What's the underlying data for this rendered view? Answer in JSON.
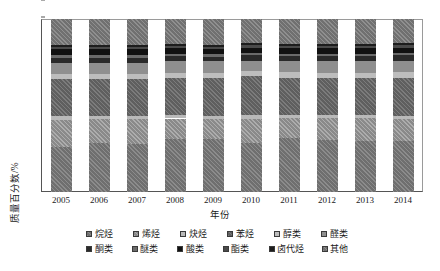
{
  "chart_data": {
    "type": "bar",
    "stacked": true,
    "title": "",
    "xlabel": "年份",
    "ylabel": "质量百分数/%",
    "ylim": [
      0,
      100
    ],
    "ytick_step": 10,
    "yticks": [
      "0",
      "10",
      "20",
      "30",
      "40",
      "50",
      "60",
      "70",
      "80",
      "90",
      "100"
    ],
    "grid": false,
    "legend_position": "bottom",
    "categories": [
      "2005",
      "2006",
      "2007",
      "2008",
      "2009",
      "2010",
      "2011",
      "2012",
      "2013",
      "2014"
    ],
    "series": [
      {
        "name": "烷烃",
        "key": "alkane",
        "values": [
          26.0,
          28.5,
          28.0,
          30.5,
          30.5,
          28.5,
          31.0,
          30.0,
          29.5,
          29.5
        ]
      },
      {
        "name": "烯烃",
        "key": "alkene",
        "values": [
          15.8,
          13.5,
          14.0,
          12.0,
          11.5,
          13.5,
          11.5,
          12.5,
          13.0,
          12.5
        ]
      },
      {
        "name": "炔烃",
        "key": "alkyne",
        "values": [
          2.2,
          2.0,
          2.0,
          2.0,
          2.0,
          2.5,
          2.0,
          2.0,
          2.0,
          2.0
        ]
      },
      {
        "name": "苯烃",
        "key": "benzene",
        "values": [
          21.5,
          21.5,
          21.5,
          21.5,
          22.0,
          22.5,
          21.5,
          21.5,
          21.5,
          22.0
        ]
      },
      {
        "name": "醇类",
        "key": "alcohol",
        "values": [
          3.0,
          3.0,
          3.0,
          3.0,
          3.0,
          3.0,
          3.5,
          3.0,
          3.0,
          3.5
        ]
      },
      {
        "name": "醛类",
        "key": "aldehyde",
        "values": [
          6.0,
          6.0,
          6.0,
          6.5,
          6.5,
          6.0,
          6.5,
          6.5,
          6.5,
          6.5
        ]
      },
      {
        "name": "酮类",
        "key": "ketone",
        "values": [
          3.0,
          3.0,
          3.0,
          3.0,
          2.5,
          3.0,
          2.5,
          3.0,
          3.0,
          3.0
        ]
      },
      {
        "name": "醚类",
        "key": "ether",
        "values": [
          1.5,
          1.5,
          1.5,
          1.5,
          1.5,
          1.5,
          1.5,
          1.5,
          1.5,
          1.5
        ]
      },
      {
        "name": "酸类",
        "key": "acid",
        "values": [
          3.5,
          3.5,
          3.5,
          3.0,
          3.0,
          3.0,
          3.0,
          3.0,
          3.0,
          3.0
        ]
      },
      {
        "name": "酯类",
        "key": "ester",
        "values": [
          1.5,
          1.5,
          1.5,
          1.5,
          1.5,
          1.5,
          1.5,
          1.5,
          1.5,
          1.5
        ]
      },
      {
        "name": "卤代烃",
        "key": "halo",
        "values": [
          1.0,
          1.0,
          1.0,
          1.0,
          1.0,
          1.0,
          1.0,
          1.0,
          1.0,
          1.0
        ]
      },
      {
        "name": "其他",
        "key": "other",
        "values": [
          15.0,
          15.0,
          15.0,
          14.5,
          15.0,
          14.0,
          14.5,
          14.5,
          14.5,
          14.0
        ]
      }
    ]
  },
  "legend": {
    "row1": [
      {
        "label": "烷烃",
        "key": "alkane"
      },
      {
        "label": "烯烃",
        "key": "alkene"
      },
      {
        "label": "炔烃",
        "key": "alkyne"
      },
      {
        "label": "苯烃",
        "key": "benzene"
      },
      {
        "label": "醇类",
        "key": "alcohol"
      },
      {
        "label": "醛类",
        "key": "aldehyde"
      }
    ],
    "row2": [
      {
        "label": "酮类",
        "key": "ketone"
      },
      {
        "label": "醚类",
        "key": "ether"
      },
      {
        "label": "酸类",
        "key": "acid"
      },
      {
        "label": "酯类",
        "key": "ester"
      },
      {
        "label": "卤代烃",
        "key": "halo"
      },
      {
        "label": "其他",
        "key": "other"
      }
    ]
  },
  "colors": {
    "alkane": "#6f6f6f",
    "alkene": "#8a8a8a",
    "alkyne": "#b9b9b9",
    "benzene": "#5f5f5f",
    "alcohol": "#bdbdbd",
    "aldehyde": "#8f8f8f",
    "ketone": "#2a2a2a",
    "ether": "#6a6a6a",
    "acid": "#111111",
    "ester": "#4a4a4a",
    "halo": "#1d1d1d",
    "other": "#707070",
    "axis": "#555555",
    "text": "#1a1a1a"
  }
}
